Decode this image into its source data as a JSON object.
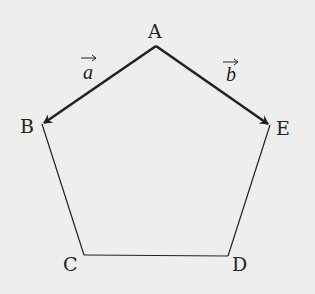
{
  "diagram": {
    "type": "pentagon-with-vectors",
    "background": "#eeeeec",
    "stroke_color": "#222222",
    "vertices": [
      {
        "label": "A",
        "x": 156,
        "y": 46
      },
      {
        "label": "B",
        "x": 42,
        "y": 124
      },
      {
        "label": "C",
        "x": 84,
        "y": 255
      },
      {
        "label": "D",
        "x": 228,
        "y": 256
      },
      {
        "label": "E",
        "x": 270,
        "y": 125
      }
    ],
    "vectors": [
      {
        "name": "a",
        "from": "A",
        "to": "B"
      },
      {
        "name": "b",
        "from": "A",
        "to": "E"
      }
    ],
    "labels": {
      "A": "A",
      "B": "B",
      "C": "C",
      "D": "D",
      "E": "E",
      "vec_a": "a",
      "vec_b": "b",
      "arrow": "→"
    }
  }
}
